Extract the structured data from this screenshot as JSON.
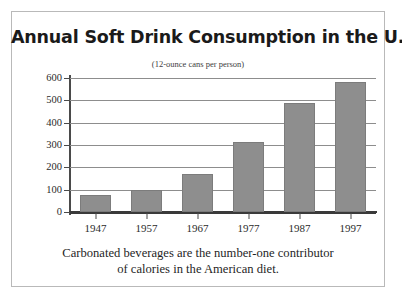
{
  "chart_data": {
    "type": "bar",
    "title": "Annual Soft Drink Consumption in the U.S.",
    "subtitle": "(12-ounce cans per person)",
    "categories": [
      "1947",
      "1957",
      "1967",
      "1977",
      "1987",
      "1997"
    ],
    "values": [
      75,
      100,
      168,
      315,
      490,
      580
    ],
    "xlabel": "",
    "ylabel": "",
    "ylim": [
      0,
      600
    ],
    "ytick_step": 100,
    "yticks": [
      "0",
      "100",
      "200",
      "300",
      "400",
      "500",
      "600"
    ],
    "grid": "horizontal",
    "legend": "none",
    "bar_color": "#8e8e8e",
    "bar_edge_color": "#7c7c7c",
    "axis_color": "#3a3a3a",
    "gridline_color": "#8d8d8d",
    "frame_color": "#b9b9b9",
    "caption_lines": [
      "Carbonated beverages are the number-one contributor",
      "of calories in the American diet."
    ]
  }
}
